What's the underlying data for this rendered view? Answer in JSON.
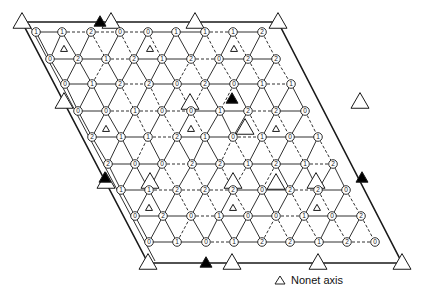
{
  "cell": {
    "corners": [
      [
        22,
        22
      ],
      [
        278,
        22
      ],
      [
        402,
        263
      ],
      [
        148,
        263
      ]
    ],
    "inner_offset": 7
  },
  "big_axes_open": [
    [
      22,
      22
    ],
    [
      111,
      22
    ],
    [
      195,
      22
    ],
    [
      278,
      22
    ],
    [
      64,
      102
    ],
    [
      360,
      102
    ],
    [
      106,
      182
    ],
    [
      316,
      182
    ],
    [
      148,
      263
    ],
    [
      232,
      263
    ],
    [
      318,
      263
    ],
    [
      402,
      263
    ],
    [
      190,
      103
    ],
    [
      245,
      128
    ],
    [
      150,
      182
    ],
    [
      233,
      182
    ],
    [
      276,
      183
    ]
  ],
  "big_axes_filled": [
    [
      100,
      22
    ],
    [
      105,
      178
    ],
    [
      362,
      178
    ],
    [
      206,
      263
    ],
    [
      232,
      99
    ]
  ],
  "nonet_axes": [
    [
      64,
      49
    ],
    [
      150,
      49
    ],
    [
      234,
      49
    ],
    [
      106,
      129
    ],
    [
      191,
      129
    ],
    [
      276,
      129
    ],
    [
      149,
      208
    ],
    [
      233,
      208
    ],
    [
      317,
      208
    ]
  ],
  "nodes": [
    {
      "x": 36,
      "y": 32,
      "l": "1"
    },
    {
      "x": 62,
      "y": 32,
      "l": "1"
    },
    {
      "x": 91,
      "y": 32,
      "l": "2"
    },
    {
      "x": 50,
      "y": 59,
      "l": "0"
    },
    {
      "x": 78,
      "y": 59,
      "l": "2"
    },
    {
      "x": 65,
      "y": 84,
      "l": "0"
    },
    {
      "x": 92,
      "y": 84,
      "l": "1"
    },
    {
      "x": 120,
      "y": 32,
      "l": "0"
    },
    {
      "x": 148,
      "y": 32,
      "l": "0"
    },
    {
      "x": 176,
      "y": 32,
      "l": "1"
    },
    {
      "x": 106,
      "y": 59,
      "l": "1"
    },
    {
      "x": 134,
      "y": 59,
      "l": "2"
    },
    {
      "x": 162,
      "y": 59,
      "l": "1"
    },
    {
      "x": 120,
      "y": 84,
      "l": "2"
    },
    {
      "x": 149,
      "y": 84,
      "l": "2"
    },
    {
      "x": 177,
      "y": 84,
      "l": "0"
    },
    {
      "x": 205,
      "y": 32,
      "l": "1"
    },
    {
      "x": 233,
      "y": 32,
      "l": "1"
    },
    {
      "x": 262,
      "y": 32,
      "l": "2"
    },
    {
      "x": 191,
      "y": 59,
      "l": "2"
    },
    {
      "x": 219,
      "y": 59,
      "l": "0"
    },
    {
      "x": 248,
      "y": 59,
      "l": "2"
    },
    {
      "x": 276,
      "y": 59,
      "l": "2"
    },
    {
      "x": 205,
      "y": 84,
      "l": "2"
    },
    {
      "x": 234,
      "y": 84,
      "l": "0"
    },
    {
      "x": 262,
      "y": 84,
      "l": "1"
    },
    {
      "x": 291,
      "y": 84,
      "l": "1"
    },
    {
      "x": 78,
      "y": 111,
      "l": "0"
    },
    {
      "x": 106,
      "y": 111,
      "l": "0"
    },
    {
      "x": 135,
      "y": 111,
      "l": "1"
    },
    {
      "x": 92,
      "y": 137,
      "l": "2"
    },
    {
      "x": 121,
      "y": 137,
      "l": "1"
    },
    {
      "x": 108,
      "y": 164,
      "l": "2"
    },
    {
      "x": 135,
      "y": 164,
      "l": "0"
    },
    {
      "x": 162,
      "y": 111,
      "l": "0"
    },
    {
      "x": 191,
      "y": 111,
      "l": "0"
    },
    {
      "x": 220,
      "y": 111,
      "l": "1"
    },
    {
      "x": 148,
      "y": 137,
      "l": "1"
    },
    {
      "x": 177,
      "y": 137,
      "l": "2"
    },
    {
      "x": 205,
      "y": 137,
      "l": "1"
    },
    {
      "x": 162,
      "y": 164,
      "l": "0"
    },
    {
      "x": 192,
      "y": 164,
      "l": "2"
    },
    {
      "x": 220,
      "y": 164,
      "l": "2"
    },
    {
      "x": 248,
      "y": 111,
      "l": "2"
    },
    {
      "x": 276,
      "y": 111,
      "l": "2"
    },
    {
      "x": 305,
      "y": 111,
      "l": "0"
    },
    {
      "x": 233,
      "y": 137,
      "l": "0"
    },
    {
      "x": 262,
      "y": 137,
      "l": "1"
    },
    {
      "x": 290,
      "y": 137,
      "l": "0"
    },
    {
      "x": 318,
      "y": 137,
      "l": "1"
    },
    {
      "x": 248,
      "y": 164,
      "l": "1"
    },
    {
      "x": 276,
      "y": 164,
      "l": "2"
    },
    {
      "x": 305,
      "y": 164,
      "l": "1"
    },
    {
      "x": 333,
      "y": 164,
      "l": "2"
    },
    {
      "x": 121,
      "y": 190,
      "l": "1"
    },
    {
      "x": 149,
      "y": 190,
      "l": "1"
    },
    {
      "x": 177,
      "y": 190,
      "l": "2"
    },
    {
      "x": 135,
      "y": 216,
      "l": "0"
    },
    {
      "x": 163,
      "y": 216,
      "l": "2"
    },
    {
      "x": 149,
      "y": 242,
      "l": "0"
    },
    {
      "x": 177,
      "y": 242,
      "l": "1"
    },
    {
      "x": 205,
      "y": 190,
      "l": "2"
    },
    {
      "x": 233,
      "y": 190,
      "l": "2"
    },
    {
      "x": 262,
      "y": 190,
      "l": "0"
    },
    {
      "x": 191,
      "y": 216,
      "l": "0"
    },
    {
      "x": 219,
      "y": 216,
      "l": "1"
    },
    {
      "x": 248,
      "y": 216,
      "l": "0"
    },
    {
      "x": 206,
      "y": 242,
      "l": "0"
    },
    {
      "x": 234,
      "y": 242,
      "l": "1"
    },
    {
      "x": 262,
      "y": 242,
      "l": "2"
    },
    {
      "x": 290,
      "y": 190,
      "l": "2"
    },
    {
      "x": 318,
      "y": 190,
      "l": "2"
    },
    {
      "x": 346,
      "y": 190,
      "l": "0"
    },
    {
      "x": 276,
      "y": 216,
      "l": "0"
    },
    {
      "x": 304,
      "y": 216,
      "l": "1"
    },
    {
      "x": 332,
      "y": 216,
      "l": "0"
    },
    {
      "x": 361,
      "y": 216,
      "l": "2"
    },
    {
      "x": 290,
      "y": 242,
      "l": "2"
    },
    {
      "x": 319,
      "y": 242,
      "l": "1"
    },
    {
      "x": 347,
      "y": 242,
      "l": "2"
    },
    {
      "x": 375,
      "y": 242,
      "l": "0"
    }
  ],
  "legend": {
    "label": "Nonet axis",
    "icon": "open-triangle-icon"
  },
  "colors": {
    "line": "#1a1a1a",
    "fill_dark": "#000000",
    "background": "#ffffff"
  }
}
